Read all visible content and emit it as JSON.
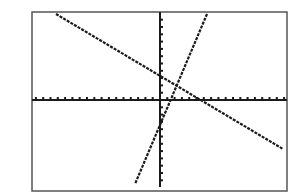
{
  "chart_data": {
    "type": "line",
    "title": "",
    "xlabel": "",
    "ylabel": "",
    "grid": false,
    "legend": null,
    "axis_ticks": {
      "x_spacing_units": 1,
      "y_spacing_units": 1
    },
    "xlim": [
      -17.5,
      17.5
    ],
    "ylim": [
      -11.5,
      11
    ],
    "series": [
      {
        "name": "line-decreasing",
        "slope": -0.59,
        "intercept": 2.2,
        "x": [
          -14.2,
          16.8
        ],
        "y": [
          10.8,
          -7.6
        ]
      },
      {
        "name": "line-increasing",
        "slope": 2.4,
        "intercept": -4.8,
        "x": [
          -3.4,
          6.4
        ],
        "y": [
          -10.5,
          10.8
        ]
      }
    ],
    "intersection": {
      "x": 2.5,
      "y": 2.1
    }
  },
  "colors": {
    "line": "#1a1a1a",
    "frame": "#555555",
    "background": "#ffffff"
  },
  "layout": {
    "frame": {
      "x1": 32,
      "y1": 12,
      "x2": 287,
      "y2": 191
    },
    "axes": {
      "x_axis_y": 100,
      "y_axis_x": 160,
      "y_axis_bottom": 187
    },
    "tick_px": 7.3,
    "lines_px": [
      {
        "x1": 56,
        "y1": 14,
        "x2": 283,
        "y2": 149
      },
      {
        "x1": 207,
        "y1": 14,
        "x2": 135,
        "y2": 184
      }
    ]
  }
}
